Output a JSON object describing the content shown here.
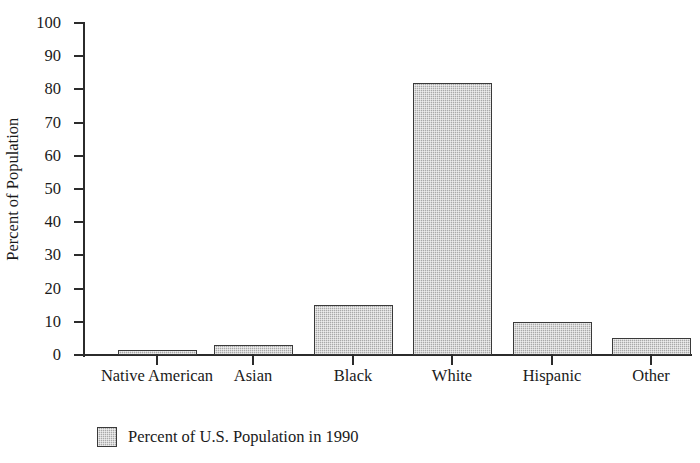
{
  "chart_data": {
    "type": "bar",
    "title": "",
    "subtitle": "",
    "xlabel": "",
    "ylabel": "Percent of Population",
    "categories": [
      "Native American",
      "Asian",
      "Black",
      "White",
      "Hispanic",
      "Other"
    ],
    "values": [
      1.5,
      3,
      15,
      82,
      10,
      5
    ],
    "series": [
      {
        "name": "Percent of U.S. Population in 1990",
        "values": [
          1.5,
          3,
          15,
          82,
          10,
          5
        ]
      }
    ],
    "ylim": [
      0,
      100
    ],
    "ytick_labels": [
      "0",
      "10",
      "20",
      "30",
      "40",
      "50",
      "60",
      "70",
      "80",
      "90",
      "100"
    ],
    "ytick_values": [
      0,
      10,
      20,
      30,
      40,
      50,
      60,
      70,
      80,
      90,
      100
    ],
    "grid": false,
    "legend_position": "bottom-left",
    "legend": [
      {
        "label": "Percent of U.S. Population in 1990",
        "swatch_color": "#a9a9a9",
        "swatch_border": "#3a3a3a"
      }
    ],
    "bar_fill_color": "#a9a9a9",
    "bar_border_color": "#3a3a3a",
    "axis_color": "#2b2b2b",
    "background_color": "#ffffff",
    "annotations": []
  }
}
